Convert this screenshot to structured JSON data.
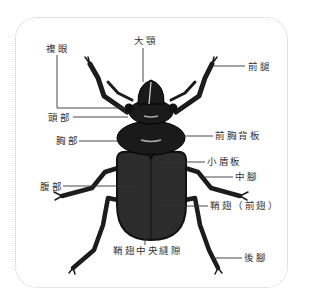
{
  "diagram": {
    "colors": {
      "body": "#1c1c1c",
      "elytra": "#2c2c2c",
      "line": "#333333",
      "border": "#c8c8c8",
      "text": "#333333"
    },
    "labels": {
      "compound_eye": "複眼",
      "mandible": "大顎",
      "foreleg": "前腿",
      "head": "頭部",
      "thorax": "胸部",
      "pronotum": "前胸背板",
      "scutellum": "小盾板",
      "midleg": "中腳",
      "abdomen": "腹部",
      "elytra": "鞘翅（前翅）",
      "elytral_suture": "鞘翅中央縫隙",
      "hindleg": "後腳"
    }
  }
}
